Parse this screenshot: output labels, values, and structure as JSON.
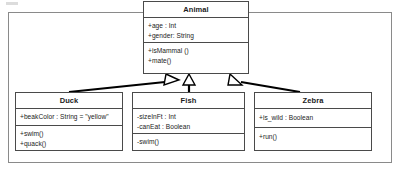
{
  "diagram": {
    "type": "uml-class-diagram",
    "title": "",
    "relationship": "generalization",
    "colors": {
      "background": "#ffffff",
      "frame_border": "#8a8a8a",
      "class_border": "#4a4a4a",
      "text": "#1b1b1b",
      "connector": "#000000"
    },
    "classes": [
      {
        "id": "animal",
        "name": "Animal",
        "attributes": [
          "+age : Int",
          "+gender: String"
        ],
        "methods": [
          "+isMammal ()",
          "+mate()"
        ]
      },
      {
        "id": "duck",
        "name": "Duck",
        "attributes": [
          "+beakColor : String = \"yellow\""
        ],
        "methods": [
          "+swim()",
          "+quack()"
        ]
      },
      {
        "id": "fish",
        "name": "Fish",
        "attributes": [
          "-sizeInFt : Int",
          "-canEat : Boolean"
        ],
        "methods": [
          "-swim()"
        ]
      },
      {
        "id": "zebra",
        "name": "Zebra",
        "attributes": [
          "+is_wild : Boolean"
        ],
        "methods": [
          "+run()"
        ]
      }
    ],
    "connections": [
      {
        "from": "duck",
        "to": "animal",
        "kind": "inheritance",
        "arrow": "hollow-triangle"
      },
      {
        "from": "fish",
        "to": "animal",
        "kind": "inheritance",
        "arrow": "hollow-triangle"
      },
      {
        "from": "zebra",
        "to": "animal",
        "kind": "inheritance",
        "arrow": "hollow-triangle"
      }
    ]
  }
}
